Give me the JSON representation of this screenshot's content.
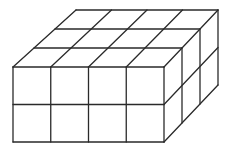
{
  "figure": {
    "dimensions": {
      "width_cubes": 4,
      "depth_cubes": 3,
      "height_cubes": 2
    },
    "total_cubes": 24,
    "colors": {
      "stroke": "#2a2a2a",
      "background": "#ffffff"
    },
    "geometry": {
      "front_left_x": 13,
      "front_right_x": 164,
      "front_top_y": 67,
      "front_bottom_y": 142,
      "back_left_top": [
        76,
        10
      ],
      "back_right_top": [
        218,
        10
      ],
      "back_right_bottom": [
        218,
        85
      ]
    }
  }
}
